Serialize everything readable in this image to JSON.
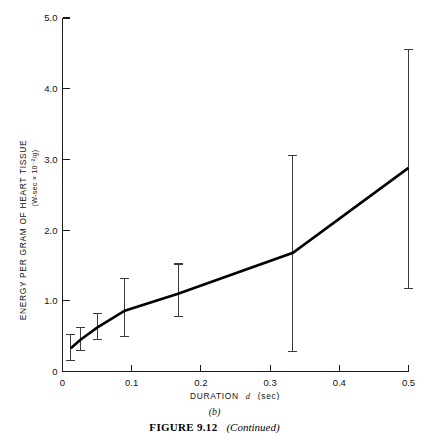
{
  "page": {
    "running_head": "",
    "panel_label": "(b)",
    "caption_label": "FIGURE 9.12",
    "caption_note": "(Continued)"
  },
  "chart_data": {
    "type": "line",
    "title": "",
    "xlabel_prefix": "DURATION",
    "xlabel_symbol": "d",
    "xlabel_units": "(sec)",
    "ylabel": "ENERGY PER GRAM OF HEART TISSUE",
    "ylabel_units": "(W-sec × 10⁻²/g)",
    "grid": false,
    "legend": null,
    "xlim": [
      0,
      0.5
    ],
    "ylim": [
      0,
      5.0
    ],
    "xticks": [
      0,
      0.1,
      0.2,
      0.3,
      0.4,
      0.5
    ],
    "xtick_labels": [
      "0",
      "0.1",
      "0.2",
      "0.3",
      "0.4",
      "0.5"
    ],
    "yticks": [
      0,
      1.0,
      2.0,
      3.0,
      4.0,
      5.0
    ],
    "ytick_labels": [
      "0",
      "1.0",
      "2.0",
      "3.0",
      "4.0",
      "5.0"
    ],
    "x": [
      0.012,
      0.026,
      0.05,
      0.09,
      0.167,
      0.333,
      0.5
    ],
    "values": [
      0.33,
      0.45,
      0.62,
      0.86,
      1.1,
      1.68,
      2.88
    ],
    "error_low": [
      0.15,
      0.3,
      0.45,
      0.5,
      0.78,
      0.28,
      1.17
    ],
    "error_high": [
      0.52,
      0.62,
      0.82,
      1.32,
      1.52,
      3.05,
      4.55
    ]
  }
}
